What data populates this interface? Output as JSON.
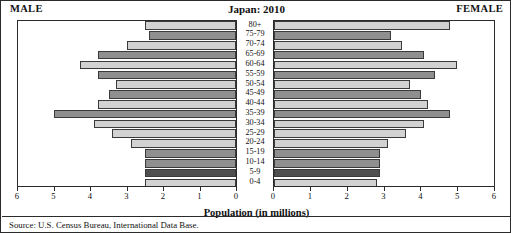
{
  "header": {
    "male_label": "MALE",
    "female_label": "FEMALE",
    "title": "Japan: 2010"
  },
  "axis_title": "Population (in millions)",
  "source": "Source: U.S. Census Bureau, International Data Base.",
  "chart_data": {
    "type": "bar",
    "subtype": "population-pyramid",
    "title": "Japan: 2010",
    "xlabel": "Population (in millions)",
    "ylabel": "",
    "xlim": [
      0,
      6
    ],
    "grid": false,
    "legend_position": "none",
    "axis_direction": {
      "male": "right-to-left",
      "female": "left-to-right"
    },
    "tick_values": [
      0,
      1,
      2,
      3,
      4,
      5,
      6
    ],
    "male_tick_labels": [
      "6",
      "5",
      "4",
      "3",
      "2",
      "1",
      "0"
    ],
    "female_tick_labels": [
      "0",
      "1",
      "2",
      "3",
      "4",
      "5",
      "6"
    ],
    "categories": [
      "80+",
      "75-79",
      "70-74",
      "65-69",
      "60-64",
      "55-59",
      "50-54",
      "45-49",
      "40-44",
      "35-39",
      "30-34",
      "25-29",
      "20-24",
      "15-19",
      "10-14",
      "5-9",
      "0-4"
    ],
    "series": [
      {
        "name": "MALE",
        "values": [
          2.5,
          2.4,
          3.0,
          3.8,
          4.3,
          3.8,
          3.3,
          3.5,
          3.8,
          5.0,
          3.9,
          3.4,
          2.9,
          2.5,
          2.5,
          2.5,
          2.5
        ]
      },
      {
        "name": "FEMALE",
        "values": [
          4.8,
          3.2,
          3.5,
          4.1,
          5.0,
          4.4,
          3.7,
          4.0,
          4.2,
          4.8,
          4.1,
          3.6,
          3.1,
          2.9,
          2.9,
          2.9,
          2.8
        ]
      }
    ],
    "bar_shades": [
      "light",
      "dark",
      "light",
      "dark",
      "light",
      "dark",
      "light",
      "dark",
      "light",
      "dark",
      "light",
      "light",
      "light",
      "dark",
      "dark",
      "darkest",
      "light"
    ]
  },
  "colors": {
    "light": "#d2d2d2",
    "dark": "#8f8f8f",
    "darkest": "#4f4f4f",
    "border": "#3a3a3a",
    "frame": "#2b2b2b",
    "background": "#ffffff"
  }
}
